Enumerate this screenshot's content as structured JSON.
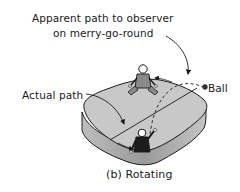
{
  "figure": {
    "caption": "(b) Rotating",
    "labels": {
      "apparent_path_line1": "Apparent path to observer",
      "apparent_path_line2": "on merry-go-round",
      "actual_path": "Actual path",
      "ball": "Ball"
    },
    "elements": {
      "platform": "merry-go-round",
      "observers": [
        "observer-back",
        "observer-front"
      ],
      "paths": [
        "actual-path-straight",
        "apparent-path-curved-dashed"
      ],
      "rotation_arrows": 2
    },
    "colors": {
      "platform_top": "#c8c8c8",
      "platform_side": "#a9a9a9",
      "ink": "#1a1a1a",
      "figure_back": "#8a8a8a",
      "figure_front": "#1c1c1c"
    }
  }
}
